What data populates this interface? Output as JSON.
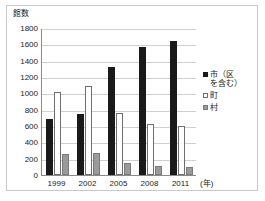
{
  "chart_data": {
    "type": "bar",
    "title": "",
    "subtitle": "",
    "xlabel": "(年)",
    "ylabel": "館数",
    "categories": [
      "1999",
      "2002",
      "2005",
      "2008",
      "2011"
    ],
    "series": [
      {
        "name": "市（区を含む）",
        "values": [
          685,
          745,
          1320,
          1565,
          1635
        ],
        "color": "#1a1a1a"
      },
      {
        "name": "町",
        "values": [
          1020,
          1085,
          755,
          620,
          595
        ],
        "color": "#ffffff"
      },
      {
        "name": "村",
        "values": [
          255,
          275,
          145,
          105,
          95
        ],
        "color": "#9a9a9a"
      }
    ],
    "ylim": [
      0,
      1800
    ],
    "ytick_labels": [
      "1800",
      "1600",
      "1400",
      "1200",
      "1000",
      "800",
      "600",
      "400",
      "200",
      "0"
    ],
    "ytick_values": [
      1800,
      1600,
      1400,
      1200,
      1000,
      800,
      600,
      400,
      200,
      0
    ],
    "grid": true,
    "legend_position": "right"
  },
  "legend": {
    "items": [
      {
        "label": "市（区\nを含む）",
        "swatch": "black-square-icon"
      },
      {
        "label": "町",
        "swatch": "white-square-icon"
      },
      {
        "label": "村",
        "swatch": "gray-square-icon"
      }
    ]
  }
}
